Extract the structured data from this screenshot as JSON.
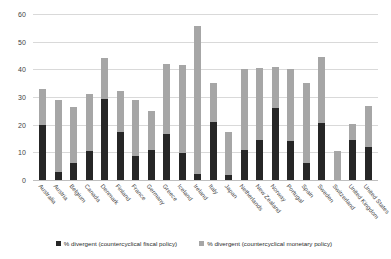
{
  "chart_data": {
    "type": "bar",
    "title": "",
    "subtitle": "",
    "xlabel": "",
    "ylabel": "",
    "ylim": [
      0,
      60
    ],
    "ytick_step": 10,
    "yticks": [
      0,
      10,
      20,
      30,
      40,
      50,
      60
    ],
    "ytick_labels": [
      "0",
      "10",
      "20",
      "30",
      "40",
      "50",
      "60"
    ],
    "grid": true,
    "stacked": true,
    "legend_position": "bottom",
    "bar_color_fiscal": "#262626",
    "bar_color_monetary": "#a6a6a6",
    "categories": [
      "Australia",
      "Austria",
      "Belgium",
      "Canada",
      "Denmark",
      "Finland",
      "France",
      "Germany",
      "Greece",
      "Iceland",
      "Ireland",
      "Italy",
      "Japan",
      "Netherlands",
      "New Zealand",
      "Norway",
      "Portugal",
      "Spain",
      "Sweden",
      "Switzerland",
      "United Kingdom",
      "United States"
    ],
    "series": [
      {
        "name": "% divergent (countercyclical fiscal policy)",
        "color": "#262626",
        "values": [
          19.8,
          2.8,
          6.0,
          10.4,
          29.2,
          17.5,
          8.8,
          10.8,
          16.7,
          9.6,
          2.3,
          21.0,
          1.8,
          11.0,
          14.5,
          26.0,
          14.2,
          6.1,
          20.5,
          0.0,
          14.4,
          11.8
        ]
      },
      {
        "name": "% divergent (countercyclical monetary policy)",
        "color": "#a6a6a6",
        "values": [
          13.2,
          26.2,
          20.5,
          20.6,
          14.8,
          14.5,
          20.2,
          14.2,
          25.3,
          32.0,
          53.2,
          14.0,
          15.7,
          29.0,
          26.0,
          15.0,
          26.0,
          29.0,
          23.9,
          10.5,
          6.0,
          14.9
        ]
      }
    ],
    "totals": [
      33.0,
      29.0,
      26.5,
      31.0,
      44.0,
      32.0,
      29.0,
      25.0,
      42.0,
      41.6,
      55.5,
      35.0,
      17.5,
      40.0,
      40.5,
      41.0,
      40.2,
      35.1,
      44.4,
      10.5,
      20.4,
      26.7
    ]
  }
}
